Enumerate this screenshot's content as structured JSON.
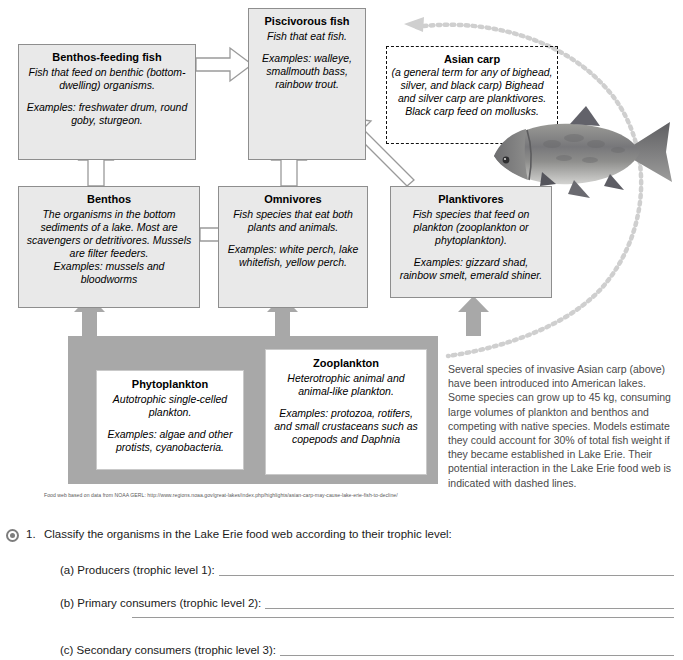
{
  "diagram": {
    "title": "Lake Erie food web",
    "boxes": {
      "piscivorous": {
        "title": "Piscivorous fish",
        "desc": "Fish that eat fish.",
        "examples": "Examples: walleye, smallmouth bass, rainbow trout."
      },
      "benthos_feeding": {
        "title": "Benthos-feeding fish",
        "desc": "Fish that feed on benthic (bottom-dwelling)  organisms.",
        "examples": "Examples: freshwater drum, round goby, sturgeon."
      },
      "benthos": {
        "title": "Benthos",
        "desc": "The organisms in the bottom sediments of a lake. Most are scavengers or detritivores. Mussels are filter feeders.",
        "examples": "Examples: mussels and bloodworms"
      },
      "omnivores": {
        "title": "Omnivores",
        "desc": "Fish species that eat  both plants and animals.",
        "examples": "Examples: white perch, lake whitefish, yellow perch."
      },
      "planktivores": {
        "title": "Planktivores",
        "desc": "Fish species that feed on plankton (zooplankton or phytoplankton).",
        "examples": "Examples: gizzard shad, rainbow smelt, emerald shiner."
      },
      "asian_carp": {
        "title": "Asian carp",
        "desc": "(a general term for any of bighead, silver, and black carp) Bighead and silver carp are planktivores. Black carp feed on mollusks."
      },
      "phytoplankton": {
        "title": "Phytoplankton",
        "desc": "Autotrophic single-celled plankton.",
        "examples": "Examples: algae and other protists, cyanobacteria."
      },
      "zooplankton": {
        "title": "Zooplankton",
        "desc": "Heterotrophic animal and animal-like plankton.",
        "examples": "Examples: protozoa, rotifers, and small crustaceans such as copepods and Daphnia"
      }
    },
    "side_caption": "Several species of invasive Asian carp (above) have been introduced into American lakes. Some species can grow up to 45 kg, consuming large volumes of plankton and benthos and competing with native species. Models estimate they could account for 30% of total fish weight if they became established in Lake Erie. Their potential interaction in the Lake Erie food web is indicated with dashed lines.",
    "credit": "Food web based on data from NOAA GERL: http://www.regions.noaa.gov/great-lakes/index.php/highlights/asian-carp-may-cause-lake-erie-fish-to-decline/",
    "photo_alt": "asian-carp-photo",
    "colors": {
      "box_fill": "#e9e9e9",
      "box_border": "#8e8e8e",
      "panel_gray": "#a8a8a8",
      "arrow_gray": "#a8a8a8",
      "caption_text": "#4a4a4a"
    }
  },
  "question": {
    "bullet": "radio-bullet",
    "number": "1.",
    "prompt": "Classify the organisms in the Lake Erie food web according to their trophic level:",
    "items": [
      {
        "label": "(a) Producers (trophic level 1):"
      },
      {
        "label": "(b) Primary consumers (trophic level 2):"
      },
      {
        "label": "(c) Secondary consumers (trophic level 3):"
      }
    ]
  }
}
